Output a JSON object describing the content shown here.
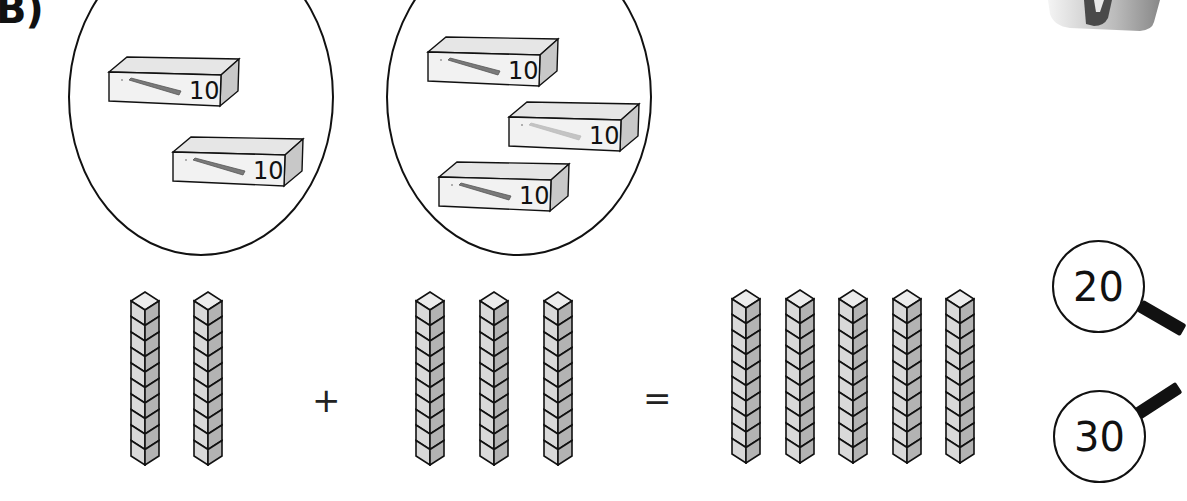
{
  "question_label": "B)",
  "groups": [
    {
      "name": "group-left",
      "boxes": [
        {
          "label": "10"
        },
        {
          "label": "10"
        }
      ],
      "count": 2
    },
    {
      "name": "group-right",
      "boxes": [
        {
          "label": "10"
        },
        {
          "label": "10"
        },
        {
          "label": "10"
        }
      ],
      "count": 3
    }
  ],
  "equation": {
    "left_rods": 2,
    "right_rods": 3,
    "result_rods": 5,
    "cubes_per_rod": 10,
    "plus_symbol": "+",
    "equals_symbol": "="
  },
  "answer_options": [
    {
      "value": "20"
    },
    {
      "value": "30"
    }
  ],
  "colors": {
    "stroke": "#111111",
    "cube_front": "#d9d9d9",
    "cube_side": "#b3b3b3",
    "cube_top": "#ececec",
    "box_front": "#f2f2f2",
    "box_side": "#c8c8c8",
    "box_top": "#e6e6e6"
  }
}
